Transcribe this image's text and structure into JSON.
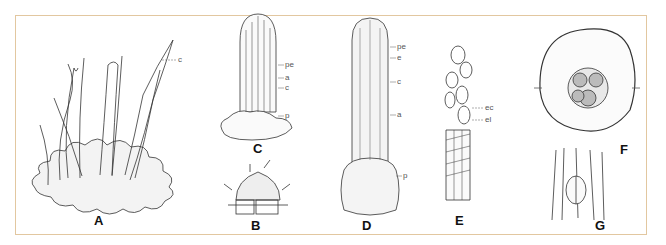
{
  "figure": {
    "frame_color": "#e2c7a0",
    "panels": [
      {
        "id": "A",
        "label": "A",
        "parts": [
          "c"
        ]
      },
      {
        "id": "C",
        "label": "C",
        "parts": [
          "pe",
          "a",
          "c",
          "p"
        ]
      },
      {
        "id": "B",
        "label": "B",
        "parts": []
      },
      {
        "id": "D",
        "label": "D",
        "parts": [
          "pe",
          "e",
          "c",
          "a",
          "p"
        ]
      },
      {
        "id": "E",
        "label": "E",
        "parts": [
          "ec",
          "el"
        ]
      },
      {
        "id": "F",
        "label": "F",
        "parts": []
      },
      {
        "id": "G",
        "label": "G",
        "parts": []
      }
    ]
  }
}
